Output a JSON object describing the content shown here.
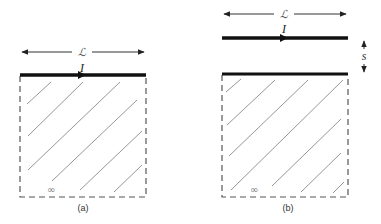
{
  "diagram": {
    "panels": [
      {
        "id": "a",
        "caption": "(a)",
        "length_label": "ℒ",
        "current_label": "I",
        "infinity_label": "∞",
        "description": "Current-carrying wire of length L lying on the edge of a semi-infinite (hatched) region extending downward to infinity"
      },
      {
        "id": "b",
        "caption": "(b)",
        "length_label": "ℒ",
        "current_label": "I",
        "separation_label": "s",
        "infinity_label": "∞",
        "description": "Current-carrying wire of length L held a distance s above the edge of a semi-infinite (hatched) region"
      }
    ],
    "colors": {
      "wire": "#111111",
      "boundary": "#555555",
      "hatch": "#8a8a8a"
    }
  }
}
